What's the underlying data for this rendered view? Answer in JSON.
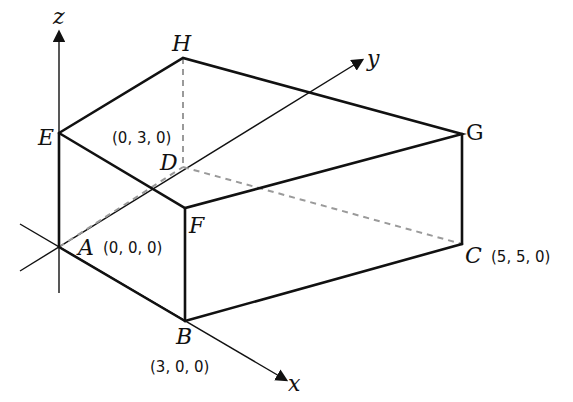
{
  "diagram": {
    "axes": {
      "x": "x",
      "y": "y",
      "z": "z"
    },
    "vertices": {
      "A": {
        "label": "A",
        "coord": "(0, 0, 0)"
      },
      "B": {
        "label": "B",
        "coord": "(3, 0, 0)"
      },
      "C": {
        "label": "C",
        "coord": "(5, 5, 0)"
      },
      "D": {
        "label": "D",
        "coord": "(0, 3, 0)"
      },
      "E": {
        "label": "E"
      },
      "F": {
        "label": "F"
      },
      "G": {
        "label": "G"
      },
      "H": {
        "label": "H"
      }
    },
    "colors": {
      "edge": "#111111",
      "hidden_edge": "#9a9a9a",
      "background": "#ffffff"
    }
  }
}
